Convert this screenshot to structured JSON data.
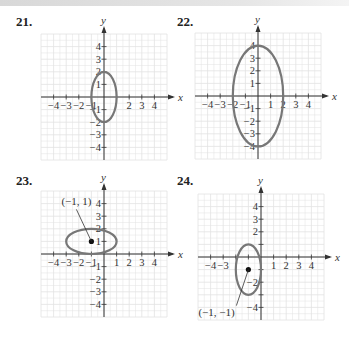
{
  "page": {
    "problems": [
      {
        "number": "21.",
        "id": 21
      },
      {
        "number": "22.",
        "id": 22
      },
      {
        "number": "23.",
        "id": 23
      },
      {
        "number": "24.",
        "id": 24
      }
    ],
    "axis_labels": {
      "x": "x",
      "y": "y"
    },
    "colors": {
      "ellipse": "#777777",
      "grid": "#e2e2e2",
      "axis": "#333333",
      "point": "#111111"
    }
  },
  "chart_data": [
    {
      "type": "line",
      "title": "21.",
      "xlabel": "x",
      "ylabel": "y",
      "xlim": [
        -5,
        5
      ],
      "ylim": [
        -5,
        5
      ],
      "grid": true,
      "x_tick_labels": [
        "-4",
        "-3",
        "-2",
        "-1",
        "2",
        "3",
        "4"
      ],
      "y_tick_labels": [
        "4",
        "3",
        "2",
        "1",
        "-1",
        "-2",
        "-3",
        "-4"
      ],
      "ellipse": {
        "center": [
          0,
          0
        ],
        "rx": 1,
        "ry": 2
      },
      "points": [],
      "annotations": []
    },
    {
      "type": "line",
      "title": "22.",
      "xlabel": "x",
      "ylabel": "y",
      "xlim": [
        -5,
        5
      ],
      "ylim": [
        -5,
        5
      ],
      "grid": true,
      "x_tick_labels": [
        "-4",
        "-3",
        "-2",
        "-1",
        "1",
        "2",
        "3",
        "4"
      ],
      "y_tick_labels": [
        "4",
        "3",
        "2",
        "1",
        "-1",
        "-2",
        "-3",
        "-4"
      ],
      "ellipse": {
        "center": [
          0,
          0
        ],
        "rx": 2,
        "ry": 4
      },
      "points": [],
      "annotations": []
    },
    {
      "type": "line",
      "title": "23.",
      "xlabel": "x",
      "ylabel": "y",
      "xlim": [
        -5,
        5
      ],
      "ylim": [
        -5,
        5
      ],
      "grid": true,
      "x_tick_labels": [
        "-4",
        "-3",
        "-2",
        "-1",
        "1",
        "2",
        "3",
        "4"
      ],
      "y_tick_labels": [
        "4",
        "3",
        "2",
        "1",
        "-1",
        "-2",
        "-3",
        "-4"
      ],
      "ellipse": {
        "center": [
          -1,
          1
        ],
        "rx": 2,
        "ry": 1
      },
      "points": [
        [
          -1,
          1
        ]
      ],
      "annotations": [
        {
          "text": "(−1, 1)",
          "points_to": [
            -1,
            1
          ]
        }
      ]
    },
    {
      "type": "line",
      "title": "24.",
      "xlabel": "x",
      "ylabel": "y",
      "xlim": [
        -5,
        5
      ],
      "ylim": [
        -5,
        5
      ],
      "grid": true,
      "x_tick_labels": [
        "-4",
        "-3",
        "1",
        "2",
        "3",
        "4"
      ],
      "y_tick_labels": [
        "4",
        "3",
        "2",
        "-2",
        "-4"
      ],
      "ellipse": {
        "center": [
          -1,
          -1
        ],
        "rx": 1,
        "ry": 2
      },
      "points": [
        [
          -1,
          -1
        ]
      ],
      "annotations": [
        {
          "text": "(−1, −1)",
          "points_to": [
            -1,
            -1
          ]
        }
      ]
    }
  ]
}
